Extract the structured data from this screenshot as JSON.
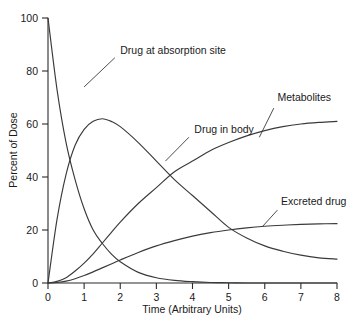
{
  "chart_data": {
    "type": "line",
    "title": "",
    "xlabel": "Time (Arbitrary Units)",
    "ylabel": "Percent of Dose",
    "xlim": [
      0,
      8
    ],
    "ylim": [
      0,
      100
    ],
    "xticks": [
      "0",
      "1",
      "2",
      "3",
      "4",
      "5",
      "6",
      "7",
      "8"
    ],
    "yticks": [
      "0",
      "20",
      "40",
      "60",
      "80",
      "100"
    ],
    "grid": false,
    "legend_position": "inline-annotations",
    "line_color": "#3a3a3a",
    "x": [
      0,
      0.25,
      0.5,
      0.75,
      1,
      1.25,
      1.5,
      1.75,
      2,
      2.5,
      3,
      3.5,
      4,
      4.5,
      5,
      5.5,
      6,
      6.5,
      7,
      7.5,
      8
    ],
    "series": [
      {
        "name": "Drug at absorption site",
        "values": [
          100,
          73,
          53,
          39,
          28,
          20,
          15,
          11,
          8,
          4,
          2,
          1,
          0.5,
          0.2,
          0.1,
          0,
          0,
          0,
          0,
          0,
          0
        ],
        "label_x": 2.0,
        "label_y": 88,
        "leader_from": [
          1.85,
          85
        ],
        "leader_to": [
          1.0,
          74
        ]
      },
      {
        "name": "Drug in body",
        "values": [
          0,
          24,
          41,
          52,
          58,
          61,
          62,
          61,
          59,
          53,
          46,
          39,
          33,
          27,
          21,
          17,
          14,
          12,
          10.5,
          9.5,
          9
        ],
        "label_x": 4.05,
        "label_y": 58,
        "leader_from": [
          3.9,
          55
        ],
        "leader_to": [
          3.25,
          46
        ]
      },
      {
        "name": "Metabolites",
        "values": [
          0,
          0.6,
          2,
          4.5,
          7.5,
          11,
          15,
          19,
          23,
          30,
          36,
          42,
          46,
          50,
          53,
          55.5,
          57.5,
          59,
          60,
          60.6,
          61
        ],
        "label_x": 6.35,
        "label_y": 70,
        "leader_from": [
          6.25,
          66
        ],
        "leader_to": [
          5.85,
          55
        ]
      },
      {
        "name": "Excreted drug",
        "values": [
          0,
          0.2,
          0.7,
          1.6,
          2.8,
          4.2,
          5.7,
          7.2,
          8.7,
          11.5,
          14,
          16,
          17.7,
          19,
          20,
          20.8,
          21.4,
          21.8,
          22.1,
          22.3,
          22.4
        ],
        "label_x": 6.45,
        "label_y": 31,
        "leader_from": [
          6.35,
          27.5
        ],
        "leader_to": [
          5.95,
          21.5
        ]
      }
    ]
  }
}
